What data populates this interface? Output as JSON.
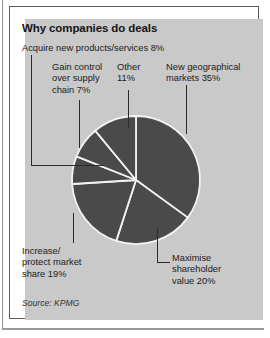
{
  "figure": {
    "title": "Why companies do deals",
    "source": "Source: KPMG",
    "panel_color": "#c9c9c9",
    "slice_color": "#4a4a4a",
    "separator_color": "#f2f2f2",
    "frame_color": "#5d5d5d",
    "text_color": "#1b1b1b"
  },
  "labels": {
    "acquire": "Acquire new products/services 8%",
    "gain_line1": "Gain control",
    "gain_line2": "over supply",
    "gain_line3": "chain 7%",
    "other_line1": "Other",
    "other_line2": "11%",
    "newgeo_line1": "New geographical",
    "newgeo_line2": "markets 35%",
    "increase_line1": "Increase/",
    "increase_line2": "protect market",
    "increase_line3": "share 19%",
    "maximise_line1": "Maximise",
    "maximise_line2": "shareholder",
    "maximise_line3": "value 20%"
  },
  "chart_data": {
    "type": "pie",
    "title": "Why companies do deals",
    "subtitle": "",
    "xlabel": "",
    "ylabel": "",
    "source": "Source: KPMG",
    "units": "percent",
    "total": 100,
    "legend_position": "callout-labels",
    "grid": false,
    "start_angle_deg": 0,
    "direction": "clockwise",
    "categories": [
      "New geographical markets",
      "Maximise shareholder value",
      "Increase/protect market share",
      "Gain control over supply chain",
      "Acquire new products/services",
      "Other"
    ],
    "values": [
      35,
      20,
      19,
      7,
      8,
      11
    ],
    "slices": [
      {
        "label": "New geographical markets",
        "value": 35,
        "display": "New geographical markets 35%"
      },
      {
        "label": "Maximise shareholder value",
        "value": 20,
        "display": "Maximise shareholder value 20%"
      },
      {
        "label": "Increase/protect market share",
        "value": 19,
        "display": "Increase/protect market share 19%"
      },
      {
        "label": "Gain control over supply chain",
        "value": 7,
        "display": "Gain control over supply chain 7%"
      },
      {
        "label": "Acquire new products/services",
        "value": 8,
        "display": "Acquire new products/services 8%"
      },
      {
        "label": "Other",
        "value": 11,
        "display": "Other 11%"
      }
    ]
  },
  "geometry": {
    "center_x": 136,
    "center_y": 180,
    "radius": 64
  }
}
